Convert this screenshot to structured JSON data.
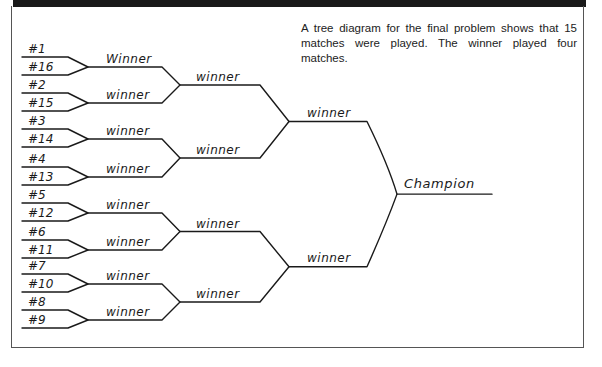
{
  "caption": "A tree diagram for the final problem shows that 15 matches were played. The winner played four matches.",
  "bracket": {
    "seeds": [
      "#1",
      "#16",
      "#2",
      "#15",
      "#3",
      "#14",
      "#4",
      "#13",
      "#5",
      "#12",
      "#6",
      "#11",
      "#7",
      "#10",
      "#8",
      "#9"
    ],
    "round1_labels": [
      "Winner",
      "winner",
      "winner",
      "winner",
      "winner",
      "winner",
      "winner",
      "winner"
    ],
    "round2_labels": [
      "winner",
      "winner",
      "winner",
      "winner"
    ],
    "semifinal_labels": [
      "winner",
      "winner"
    ],
    "final_label": "Champion",
    "matches_played": 15,
    "winner_matches": 4
  }
}
